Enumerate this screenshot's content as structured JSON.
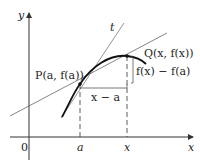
{
  "diagram": {
    "axes": {
      "y_label": "y",
      "x_label": "x",
      "origin_label": "0"
    },
    "ticks": {
      "a_label": "a",
      "x_label": "x"
    },
    "points": {
      "P_label": "P(a, f(a))",
      "Q_label": "Q(x, f(x))"
    },
    "tangent_label": "t",
    "increments": {
      "horizontal_label": "x − a",
      "vertical_label": "f(x) − f(a)"
    },
    "colors": {
      "curve": "#111111",
      "lines": "#555555",
      "axes": "#333333"
    }
  }
}
